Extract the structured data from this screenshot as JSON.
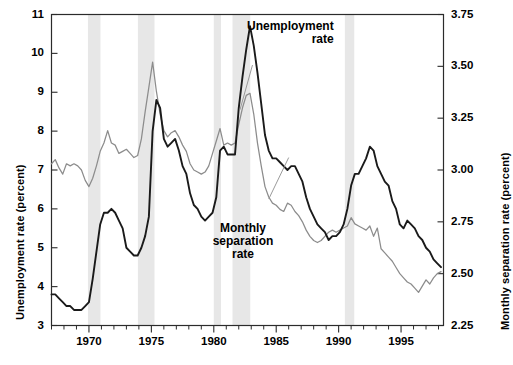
{
  "chart_data": {
    "type": "line",
    "title": "",
    "xlabel": "",
    "ylabel": "Unemployment rate (percent)",
    "y2label": "Monthly separation rate (percent)",
    "xlim": [
      1967.0,
      1998.4
    ],
    "ylim": [
      3,
      11
    ],
    "y2lim": [
      2.25,
      3.75
    ],
    "grid": false,
    "legend_position": "inline-annotation",
    "x_ticks_major": [
      1970,
      1975,
      1980,
      1985,
      1990,
      1995
    ],
    "x_tick_labels": [
      "1970",
      "1975",
      "1980",
      "1985",
      "1990",
      "1995"
    ],
    "x_ticks_minor_step": 1,
    "y_ticks": [
      3,
      4,
      5,
      6,
      7,
      8,
      9,
      10,
      11
    ],
    "y_tick_labels": [
      "3",
      "4",
      "5",
      "6",
      "7",
      "8",
      "9",
      "10",
      "11"
    ],
    "y2_ticks": [
      2.25,
      2.5,
      2.75,
      3.0,
      3.25,
      3.5,
      3.75
    ],
    "y2_tick_labels": [
      "2.25",
      "2.50",
      "2.75",
      "3.00",
      "3.25",
      "3.50",
      "3.75"
    ],
    "colors": {
      "unemployment_line": "#1a1a1a",
      "separation_line": "#8c8c8c",
      "recession_band": "#e7e7e7",
      "axis": "#2b2b2b",
      "background": "#ffffff"
    },
    "annotations": [
      {
        "name": "unemployment-label",
        "text": "Unemployment\nrate",
        "x": 1983.2,
        "y": 10.6,
        "bold": true
      },
      {
        "name": "separation-label",
        "text": "Monthly\nseparation\nrate",
        "x": 1985.0,
        "y": 6.0,
        "bold": true
      }
    ],
    "recession_bands": [
      {
        "start": 1969.92,
        "end": 1970.92
      },
      {
        "start": 1973.92,
        "end": 1975.25
      },
      {
        "start": 1980.0,
        "end": 1980.58
      },
      {
        "start": 1981.5,
        "end": 1982.92
      },
      {
        "start": 1990.5,
        "end": 1991.25
      }
    ],
    "series": [
      {
        "name": "Unemployment rate",
        "axis": "left",
        "unit": "percent",
        "color": "#1a1a1a",
        "x": [
          1967.0,
          1967.3,
          1967.6,
          1967.9,
          1968.2,
          1968.5,
          1968.8,
          1969.1,
          1969.4,
          1969.7,
          1970.0,
          1970.3,
          1970.6,
          1970.9,
          1971.2,
          1971.5,
          1971.8,
          1972.1,
          1972.4,
          1972.7,
          1973.0,
          1973.3,
          1973.6,
          1973.9,
          1974.2,
          1974.5,
          1974.8,
          1975.1,
          1975.4,
          1975.7,
          1976.0,
          1976.3,
          1976.6,
          1976.9,
          1977.2,
          1977.5,
          1977.8,
          1978.1,
          1978.4,
          1978.7,
          1979.0,
          1979.3,
          1979.6,
          1979.9,
          1980.2,
          1980.5,
          1980.8,
          1981.1,
          1981.4,
          1981.7,
          1982.0,
          1982.3,
          1982.6,
          1982.9,
          1983.2,
          1983.5,
          1983.8,
          1984.1,
          1984.4,
          1984.7,
          1985.0,
          1985.3,
          1985.6,
          1985.9,
          1986.2,
          1986.5,
          1986.8,
          1987.1,
          1987.4,
          1987.7,
          1988.0,
          1988.3,
          1988.6,
          1988.9,
          1989.2,
          1989.5,
          1989.8,
          1990.1,
          1990.4,
          1990.7,
          1991.0,
          1991.3,
          1991.6,
          1991.9,
          1992.2,
          1992.5,
          1992.8,
          1993.1,
          1993.4,
          1993.7,
          1994.0,
          1994.3,
          1994.6,
          1994.9,
          1995.2,
          1995.5,
          1995.8,
          1996.1,
          1996.4,
          1996.7,
          1997.0,
          1997.3,
          1997.6,
          1997.9,
          1998.2
        ],
        "y": [
          3.8,
          3.8,
          3.7,
          3.6,
          3.5,
          3.5,
          3.4,
          3.4,
          3.4,
          3.5,
          3.6,
          4.2,
          4.9,
          5.6,
          5.9,
          5.9,
          6.0,
          5.9,
          5.7,
          5.5,
          5.0,
          4.9,
          4.8,
          4.8,
          5.0,
          5.3,
          5.8,
          8.0,
          8.8,
          8.6,
          7.8,
          7.6,
          7.7,
          7.8,
          7.5,
          7.1,
          6.9,
          6.4,
          6.1,
          6.0,
          5.8,
          5.7,
          5.8,
          5.9,
          6.3,
          7.5,
          7.6,
          7.4,
          7.4,
          7.4,
          8.6,
          9.4,
          10.1,
          10.7,
          10.2,
          9.5,
          8.7,
          7.9,
          7.5,
          7.3,
          7.3,
          7.2,
          7.1,
          7.0,
          7.1,
          7.1,
          6.9,
          6.7,
          6.3,
          6.0,
          5.8,
          5.6,
          5.5,
          5.4,
          5.2,
          5.3,
          5.3,
          5.4,
          5.6,
          6.0,
          6.6,
          6.9,
          6.9,
          7.1,
          7.3,
          7.6,
          7.5,
          7.1,
          6.9,
          6.7,
          6.6,
          6.2,
          6.0,
          5.6,
          5.5,
          5.7,
          5.6,
          5.5,
          5.3,
          5.2,
          5.0,
          4.9,
          4.7,
          4.6,
          4.5
        ],
        "peak_values": [
          {
            "x": 1982.9,
            "y": 10.7
          },
          {
            "x": 1975.2,
            "y": 8.9
          },
          {
            "x": 1992.5,
            "y": 7.6
          }
        ],
        "min_value": {
          "x": 1968.8,
          "y": 3.4
        },
        "end_value": {
          "x": 1998.2,
          "y": 4.5
        }
      },
      {
        "name": "Monthly separation rate",
        "axis": "right",
        "unit": "percent",
        "color": "#8c8c8c",
        "x": [
          1967.0,
          1967.3,
          1967.6,
          1967.9,
          1968.2,
          1968.5,
          1968.8,
          1969.1,
          1969.4,
          1969.7,
          1970.0,
          1970.3,
          1970.6,
          1970.9,
          1971.2,
          1971.5,
          1971.8,
          1972.1,
          1972.4,
          1972.7,
          1973.0,
          1973.3,
          1973.6,
          1973.9,
          1974.2,
          1974.5,
          1974.8,
          1975.1,
          1975.4,
          1975.7,
          1976.0,
          1976.3,
          1976.6,
          1976.9,
          1977.2,
          1977.5,
          1977.8,
          1978.1,
          1978.4,
          1978.7,
          1979.0,
          1979.3,
          1979.6,
          1979.9,
          1980.2,
          1980.5,
          1980.8,
          1981.1,
          1981.4,
          1981.7,
          1982.0,
          1982.3,
          1982.6,
          1982.9,
          1983.2,
          1983.5,
          1983.8,
          1984.1,
          1984.4,
          1984.7,
          1985.0,
          1985.3,
          1985.6,
          1985.9,
          1986.2,
          1986.5,
          1986.8,
          1987.1,
          1987.4,
          1987.7,
          1988.0,
          1988.3,
          1988.6,
          1988.9,
          1989.2,
          1989.5,
          1989.8,
          1990.1,
          1990.4,
          1990.7,
          1991.0,
          1991.3,
          1991.6,
          1991.9,
          1992.2,
          1992.5,
          1992.8,
          1993.1,
          1993.4,
          1993.7,
          1994.0,
          1994.3,
          1994.6,
          1994.9,
          1995.2,
          1995.5,
          1995.8,
          1996.1,
          1996.4,
          1996.7,
          1997.0,
          1997.3,
          1997.6,
          1997.9,
          1998.2
        ],
        "y_right_axis": [
          3.03,
          3.05,
          3.01,
          2.98,
          3.03,
          3.02,
          3.03,
          3.02,
          3.0,
          2.95,
          2.92,
          2.96,
          3.02,
          3.09,
          3.13,
          3.19,
          3.13,
          3.12,
          3.08,
          3.09,
          3.1,
          3.08,
          3.06,
          3.07,
          3.15,
          3.28,
          3.4,
          3.52,
          3.38,
          3.27,
          3.19,
          3.16,
          3.18,
          3.19,
          3.16,
          3.12,
          3.09,
          3.03,
          3.0,
          2.99,
          2.98,
          2.99,
          3.02,
          3.08,
          3.14,
          3.2,
          3.12,
          3.13,
          3.12,
          3.13,
          3.22,
          3.3,
          3.36,
          3.37,
          3.27,
          3.13,
          3.02,
          2.92,
          2.87,
          2.84,
          2.83,
          2.81,
          2.8,
          2.84,
          2.83,
          2.8,
          2.78,
          2.75,
          2.71,
          2.68,
          2.66,
          2.65,
          2.66,
          2.68,
          2.7,
          2.71,
          2.7,
          2.71,
          2.72,
          2.73,
          2.77,
          2.74,
          2.73,
          2.72,
          2.71,
          2.73,
          2.68,
          2.72,
          2.62,
          2.6,
          2.58,
          2.56,
          2.53,
          2.5,
          2.48,
          2.46,
          2.45,
          2.43,
          2.41,
          2.44,
          2.47,
          2.45,
          2.48,
          2.5,
          2.51
        ],
        "peak_values": [
          {
            "x": 1975.1,
            "y": 3.52
          },
          {
            "x": 1982.9,
            "y": 3.37
          },
          {
            "x": 1971.5,
            "y": 3.19
          }
        ],
        "min_value": {
          "x": 1996.4,
          "y": 2.41
        },
        "end_value": {
          "x": 1998.2,
          "y": 2.51
        }
      }
    ]
  }
}
